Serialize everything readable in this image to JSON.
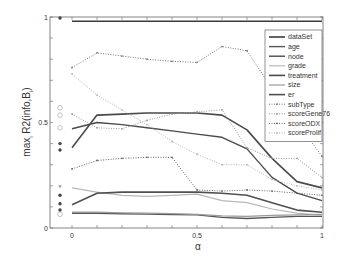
{
  "chart_data": {
    "type": "line",
    "title": "",
    "xlabel": "α",
    "ylabel": "max_i R2(info, B_i)",
    "ylabel_main": "max",
    "ylabel_sub": "i",
    "ylabel_rest": " R2(info,B",
    "ylabel_sub2": "i",
    "ylabel_end": ")",
    "xlim": [
      -0.18,
      1.0
    ],
    "ylim": [
      0,
      1
    ],
    "x_ticks": [
      0,
      0.1,
      0.2,
      0.3,
      0.4,
      0.5,
      0.6,
      0.7,
      0.8,
      0.9,
      1.0
    ],
    "x_tick_labels": [
      {
        "x": 0,
        "label": "0"
      },
      {
        "x": 0.5,
        "label": "0.5"
      },
      {
        "x": 1,
        "label": "1"
      }
    ],
    "y_ticks": [
      0,
      0.1,
      0.2,
      0.3,
      0.4,
      0.5,
      0.6,
      0.7,
      0.8,
      0.9,
      1.0
    ],
    "y_tick_labels": [
      {
        "y": 0,
        "label": "0"
      },
      {
        "y": 0.5,
        "label": "0.5"
      },
      {
        "y": 1,
        "label": "1"
      }
    ],
    "grid": false,
    "legend_position": "upper right",
    "x": [
      0,
      0.1,
      0.2,
      0.3,
      0.4,
      0.5,
      0.6,
      0.7,
      0.8,
      0.9,
      1.0
    ],
    "series": [
      {
        "name": "dataSet",
        "style": "solid",
        "color": "#3a3a3a",
        "width": 1.6,
        "values": [
          0.98,
          0.98,
          0.98,
          0.98,
          0.98,
          0.98,
          0.98,
          0.98,
          0.98,
          0.98,
          0.98
        ]
      },
      {
        "name": "age",
        "style": "solid",
        "color": "#555555",
        "width": 1.4,
        "values": [
          0.07,
          0.07,
          0.068,
          0.066,
          0.064,
          0.062,
          0.05,
          0.045,
          0.05,
          0.055,
          0.055
        ]
      },
      {
        "name": "node",
        "style": "solid",
        "color": "#4a4a4a",
        "width": 1.4,
        "values": [
          0.47,
          0.5,
          0.49,
          0.475,
          0.46,
          0.445,
          0.43,
          0.375,
          0.24,
          0.165,
          0.13
        ]
      },
      {
        "name": "grade",
        "style": "solid",
        "color": "#b8b8b8",
        "width": 1.2,
        "values": [
          0.19,
          0.17,
          0.155,
          0.15,
          0.155,
          0.16,
          0.13,
          0.12,
          0.09,
          0.07,
          0.06
        ]
      },
      {
        "name": "treatment",
        "style": "solid",
        "color": "#4a4a4a",
        "width": 1.6,
        "values": [
          0.38,
          0.535,
          0.54,
          0.545,
          0.545,
          0.545,
          0.535,
          0.465,
          0.33,
          0.22,
          0.19
        ]
      },
      {
        "name": "size",
        "style": "solid",
        "color": "#9a9a9a",
        "width": 1.2,
        "values": [
          0.075,
          0.075,
          0.072,
          0.07,
          0.068,
          0.065,
          0.058,
          0.055,
          0.06,
          0.062,
          0.065
        ]
      },
      {
        "name": "er",
        "style": "solid",
        "color": "#505050",
        "width": 1.6,
        "values": [
          0.11,
          0.165,
          0.17,
          0.17,
          0.17,
          0.17,
          0.165,
          0.155,
          0.12,
          0.085,
          0.075
        ]
      },
      {
        "name": "subType",
        "style": "dotted",
        "color": "#777777",
        "width": 1.0,
        "values": [
          0.76,
          0.83,
          0.815,
          0.8,
          0.79,
          0.785,
          0.86,
          0.84,
          0.66,
          0.5,
          0.34
        ]
      },
      {
        "name": "scoreGene76",
        "style": "dotted",
        "color": "#999999",
        "width": 1.0,
        "values": [
          0.54,
          0.475,
          0.47,
          0.51,
          0.54,
          0.55,
          0.56,
          0.38,
          0.33,
          0.33,
          0.24
        ]
      },
      {
        "name": "scoreODX",
        "style": "dotted",
        "color": "#666666",
        "width": 1.0,
        "values": [
          0.28,
          0.32,
          0.33,
          0.335,
          0.335,
          0.18,
          0.175,
          0.18,
          0.175,
          0.165,
          0.155
        ]
      },
      {
        "name": "scoreProlif",
        "style": "dotted",
        "color": "#b5b5b5",
        "width": 1.0,
        "values": [
          0.73,
          0.63,
          0.56,
          0.49,
          0.41,
          0.35,
          0.3,
          0.3,
          0.23,
          0.2,
          0.18
        ]
      }
    ],
    "markers_at_left": [
      {
        "y": 0.995,
        "shape": "filled-circle"
      },
      {
        "y": 0.57,
        "shape": "open-circle"
      },
      {
        "y": 0.535,
        "shape": "open-circle"
      },
      {
        "y": 0.475,
        "shape": "open-circle"
      },
      {
        "y": 0.4,
        "shape": "filled-circle"
      },
      {
        "y": 0.37,
        "shape": "filled-circle"
      },
      {
        "y": 0.195,
        "shape": "small-triangle"
      },
      {
        "y": 0.155,
        "shape": "filled-circle"
      },
      {
        "y": 0.115,
        "shape": "filled-circle"
      },
      {
        "y": 0.085,
        "shape": "filled-circle"
      },
      {
        "y": 0.065,
        "shape": "open-circle"
      }
    ],
    "marker_x": -0.1
  }
}
